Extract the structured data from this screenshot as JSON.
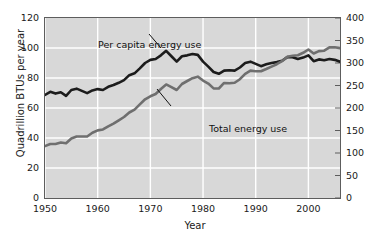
{
  "chart_data": {
    "type": "line",
    "title": "",
    "xlabel": "Year",
    "ylabel": "Quadrillion BTUs per year",
    "ylabel_right": "Million BTUs per person per year",
    "xlim": [
      1950,
      2006
    ],
    "ylim": [
      0,
      120
    ],
    "ylim_right": [
      0,
      400
    ],
    "grid": true,
    "legend_position": "inline-annotations",
    "background_color": "#d8d8d8",
    "gridline_color": "#ffffff",
    "xticks": [
      1950,
      1960,
      1970,
      1980,
      1990,
      2000
    ],
    "xtick_labels": [
      "1950",
      "1960",
      "1970",
      "1980",
      "1990",
      "2000"
    ],
    "yticks_left": [
      0,
      20,
      40,
      60,
      80,
      100,
      120
    ],
    "ytick_labels_left": [
      "0",
      "20",
      "40",
      "60",
      "80",
      "100",
      "120"
    ],
    "yticks_right": [
      0,
      50,
      100,
      150,
      200,
      250,
      300,
      350,
      400
    ],
    "ytick_labels_right": [
      "0",
      "50",
      "100",
      "150",
      "200",
      "250",
      "300",
      "350",
      "400"
    ],
    "annotations": [
      {
        "text": "Per capita energy use",
        "x": 1952.5,
        "y": 117
      },
      {
        "text": "Total energy use",
        "x": 1971.5,
        "y": 57
      }
    ],
    "series": [
      {
        "name": "Per capita energy use",
        "axis": "right",
        "units": "Million BTUs per person per year",
        "color": "#1c1c1c",
        "line_width": 2.6,
        "x": [
          1950,
          1951,
          1952,
          1953,
          1954,
          1955,
          1956,
          1957,
          1958,
          1959,
          1960,
          1961,
          1962,
          1963,
          1964,
          1965,
          1966,
          1967,
          1968,
          1969,
          1970,
          1971,
          1972,
          1973,
          1974,
          1975,
          1976,
          1977,
          1978,
          1979,
          1980,
          1981,
          1982,
          1983,
          1984,
          1985,
          1986,
          1987,
          1988,
          1989,
          1990,
          1991,
          1992,
          1993,
          1994,
          1995,
          1996,
          1997,
          1998,
          1999,
          2000,
          2001,
          2002,
          2003,
          2004,
          2005,
          2006
        ],
        "values": [
          229,
          236,
          232,
          235,
          227,
          240,
          243,
          238,
          233,
          239,
          242,
          240,
          247,
          251,
          256,
          262,
          273,
          277,
          288,
          300,
          307,
          309,
          317,
          327,
          315,
          303,
          315,
          317,
          320,
          318,
          303,
          292,
          280,
          276,
          283,
          284,
          283,
          290,
          300,
          303,
          298,
          293,
          297,
          300,
          302,
          305,
          313,
          313,
          309,
          312,
          317,
          304,
          308,
          306,
          309,
          307,
          303
        ]
      },
      {
        "name": "Total energy use",
        "axis": "left",
        "units": "Quadrillion BTUs per year",
        "color": "#6f6f6f",
        "line_width": 2.6,
        "x": [
          1950,
          1951,
          1952,
          1953,
          1954,
          1955,
          1956,
          1957,
          1958,
          1959,
          1960,
          1961,
          1962,
          1963,
          1964,
          1965,
          1966,
          1967,
          1968,
          1969,
          1970,
          1971,
          1972,
          1973,
          1974,
          1975,
          1976,
          1977,
          1978,
          1979,
          1980,
          1981,
          1982,
          1983,
          1984,
          1985,
          1986,
          1987,
          1988,
          1989,
          1990,
          1991,
          1992,
          1993,
          1994,
          1995,
          1996,
          1997,
          1998,
          1999,
          2000,
          2001,
          2002,
          2003,
          2004,
          2005,
          2006
        ],
        "values": [
          34.6,
          36.0,
          36.0,
          37.0,
          36.5,
          39.7,
          41.0,
          41.0,
          41.0,
          43.5,
          45.1,
          45.7,
          47.8,
          49.6,
          51.8,
          54.0,
          57.0,
          58.9,
          62.4,
          65.8,
          67.8,
          69.3,
          72.7,
          75.7,
          73.9,
          72.0,
          76.0,
          78.0,
          79.9,
          80.9,
          78.3,
          76.3,
          73.1,
          73.0,
          76.7,
          76.5,
          76.8,
          79.2,
          82.8,
          84.9,
          84.5,
          84.5,
          86.0,
          87.6,
          89.2,
          91.2,
          94.2,
          94.8,
          95.2,
          96.8,
          99.0,
          96.3,
          97.9,
          98.2,
          100.4,
          100.5,
          99.9
        ]
      }
    ]
  }
}
